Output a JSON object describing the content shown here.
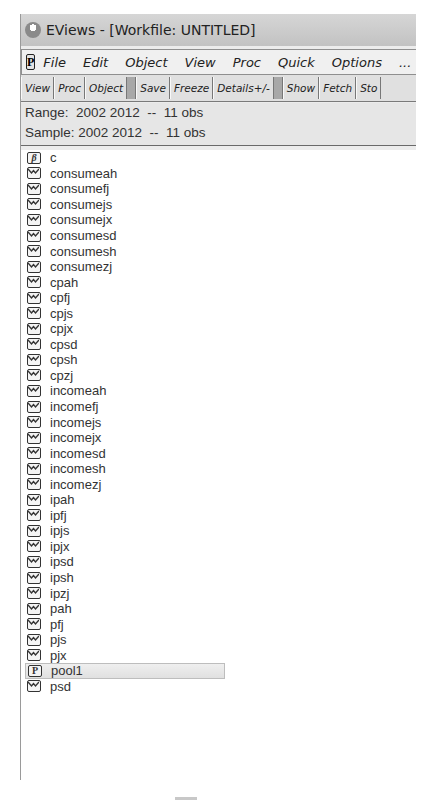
{
  "window": {
    "title": "EViews - [Workfile: UNTITLED]",
    "app_icon": "eviews-app-icon"
  },
  "menubar": {
    "p_icon": "P",
    "items": [
      "File",
      "Edit",
      "Object",
      "View",
      "Proc",
      "Quick",
      "Options",
      "..."
    ]
  },
  "toolbar": {
    "buttons": [
      "View",
      "Proc",
      "Object",
      "Save",
      "Freeze",
      "Details+/-",
      "Show",
      "Fetch",
      "Sto"
    ]
  },
  "info": {
    "range": "Range:  2002 2012  --  11 obs",
    "sample": "Sample: 2002 2012  --  11 obs"
  },
  "objects": [
    {
      "name": "c",
      "type": "coef",
      "icon": "β"
    },
    {
      "name": "consumeah",
      "type": "series"
    },
    {
      "name": "consumefj",
      "type": "series"
    },
    {
      "name": "consumejs",
      "type": "series"
    },
    {
      "name": "consumejx",
      "type": "series"
    },
    {
      "name": "consumesd",
      "type": "series"
    },
    {
      "name": "consumesh",
      "type": "series"
    },
    {
      "name": "consumezj",
      "type": "series"
    },
    {
      "name": "cpah",
      "type": "series"
    },
    {
      "name": "cpfj",
      "type": "series"
    },
    {
      "name": "cpjs",
      "type": "series"
    },
    {
      "name": "cpjx",
      "type": "series"
    },
    {
      "name": "cpsd",
      "type": "series"
    },
    {
      "name": "cpsh",
      "type": "series"
    },
    {
      "name": "cpzj",
      "type": "series"
    },
    {
      "name": "incomeah",
      "type": "series"
    },
    {
      "name": "incomefj",
      "type": "series"
    },
    {
      "name": "incomejs",
      "type": "series"
    },
    {
      "name": "incomejx",
      "type": "series"
    },
    {
      "name": "incomesd",
      "type": "series"
    },
    {
      "name": "incomesh",
      "type": "series"
    },
    {
      "name": "incomezj",
      "type": "series"
    },
    {
      "name": "ipah",
      "type": "series"
    },
    {
      "name": "ipfj",
      "type": "series"
    },
    {
      "name": "ipjs",
      "type": "series"
    },
    {
      "name": "ipjx",
      "type": "series"
    },
    {
      "name": "ipsd",
      "type": "series"
    },
    {
      "name": "ipsh",
      "type": "series"
    },
    {
      "name": "ipzj",
      "type": "series"
    },
    {
      "name": "pah",
      "type": "series"
    },
    {
      "name": "pfj",
      "type": "series"
    },
    {
      "name": "pjs",
      "type": "series"
    },
    {
      "name": "pjx",
      "type": "series"
    },
    {
      "name": "pool1",
      "type": "pool",
      "icon": "P",
      "selected": true
    },
    {
      "name": "psd",
      "type": "series"
    }
  ]
}
